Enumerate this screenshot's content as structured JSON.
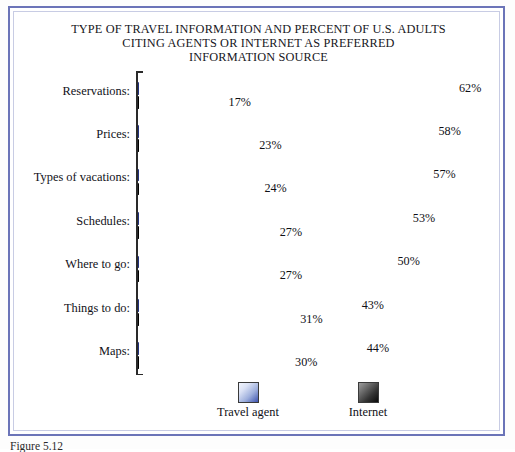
{
  "figure": {
    "caption": "Figure 5.12",
    "frame_color": "#6b74b8"
  },
  "chart_data": {
    "type": "bar",
    "orientation": "horizontal",
    "title": "TYPE OF TRAVEL INFORMATION AND PERCENT OF U.S. ADULTS CITING AGENTS OR INTERNET AS PREFERRED INFORMATION SOURCE",
    "title_lines": [
      "TYPE OF TRAVEL INFORMATION AND PERCENT OF U.S. ADULTS",
      "CITING AGENTS OR INTERNET AS PREFERRED",
      "INFORMATION SOURCE"
    ],
    "xlabel": "",
    "ylabel": "",
    "grid": false,
    "legend_position": "bottom",
    "xlim": [
      0,
      65
    ],
    "value_suffix": "%",
    "categories": [
      "Reservations:",
      "Prices:",
      "Types of vacations:",
      "Schedules:",
      "Where to go:",
      "Things to do:",
      "Maps:"
    ],
    "series": [
      {
        "name": "Travel agent",
        "color": "#2c3f9c",
        "values": [
          62,
          58,
          57,
          53,
          50,
          43,
          44
        ],
        "labels": [
          "62%",
          "58%",
          "57%",
          "53%",
          "50%",
          "43%",
          "44%"
        ]
      },
      {
        "name": "Internet",
        "color": "#101010",
        "values": [
          17,
          23,
          24,
          27,
          27,
          31,
          30
        ],
        "labels": [
          "17%",
          "23%",
          "24%",
          "27%",
          "27%",
          "31%",
          "30%"
        ]
      }
    ]
  },
  "legend": {
    "items": [
      {
        "label": "Travel agent",
        "swatch": "blue-gradient-swatch"
      },
      {
        "label": "Internet",
        "swatch": "dark-gradient-swatch"
      }
    ]
  }
}
